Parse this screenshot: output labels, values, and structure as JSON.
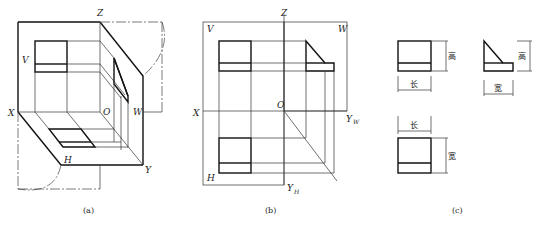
{
  "panels": {
    "a": {
      "caption": "(a)",
      "labels": {
        "Z": "Z",
        "V": "V",
        "X": "X",
        "O": "O",
        "W": "W",
        "H": "H",
        "Y": "Y"
      }
    },
    "b": {
      "caption": "(b)",
      "labels": {
        "Z": "Z",
        "V": "V",
        "W": "W",
        "X": "X",
        "O": "O",
        "Y": "Y",
        "YW_sub": "W",
        "H": "H",
        "YH_sub": "H"
      }
    },
    "c": {
      "caption": "(c)",
      "dimensions": {
        "front_height": "高",
        "front_length": "长",
        "side_height": "高",
        "side_width": "宽",
        "top_length": "长",
        "top_width": "宽"
      }
    }
  }
}
